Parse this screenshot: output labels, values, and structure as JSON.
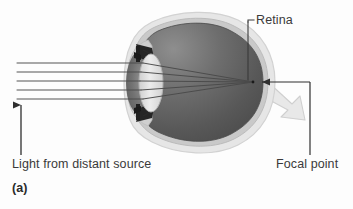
{
  "figure": {
    "panel_label": "(a)",
    "caption_labels": {
      "retina": "Retina",
      "focal_point": "Focal point",
      "light_source": "Light from distant source"
    },
    "colors": {
      "sclera_outline": "#d9d9d9",
      "sclera_fill": "#ebebeb",
      "choroid": "#bfbfbf",
      "vitreous_dark": "#585858",
      "vitreous_light": "#8a8a8a",
      "lens_fill": "#e2e2e2",
      "iris_dark": "#2d2d2d",
      "cornea_fill": "#c8c8c8",
      "optic_nerve": "#e6e6e6",
      "ray_stroke": "#4a4a4a",
      "leader_stroke": "#3a3a3a",
      "text": "#3a3a3a",
      "background": "#fdfdfd"
    },
    "diagram": {
      "type": "eye-optics-ray-diagram",
      "subject": "human eye focusing parallel light from a distant source onto the retina",
      "focal_point": {
        "x": 253,
        "y": 82
      },
      "ray_count": 5,
      "ray_start_x": 17,
      "ray_y_positions": [
        63,
        72,
        81,
        90,
        99
      ],
      "lens_x": 150,
      "source_arrow": {
        "x": 21,
        "y_top": 103,
        "y_bottom": 155
      },
      "retina_leader": {
        "x": 248,
        "y_top": 22,
        "y_bottom": 80
      },
      "focal_leader": {
        "x": 310,
        "y_top": 155,
        "y_bottom": 82,
        "arrow_tip_x": 258
      }
    }
  }
}
